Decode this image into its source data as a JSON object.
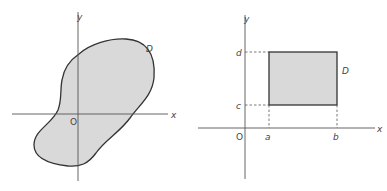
{
  "figures": [
    {
      "name": "general-region",
      "labels": {
        "y_axis": "y",
        "x_axis": "x",
        "origin": "O",
        "region": "D"
      },
      "region_fill": "#d9d9d9"
    },
    {
      "name": "rectangular-region",
      "labels": {
        "y_axis": "y",
        "x_axis": "x",
        "origin": "O",
        "region": "D",
        "x_lower": "a",
        "x_upper": "b",
        "y_lower": "c",
        "y_upper": "d"
      },
      "region_fill": "#d9d9d9"
    }
  ]
}
